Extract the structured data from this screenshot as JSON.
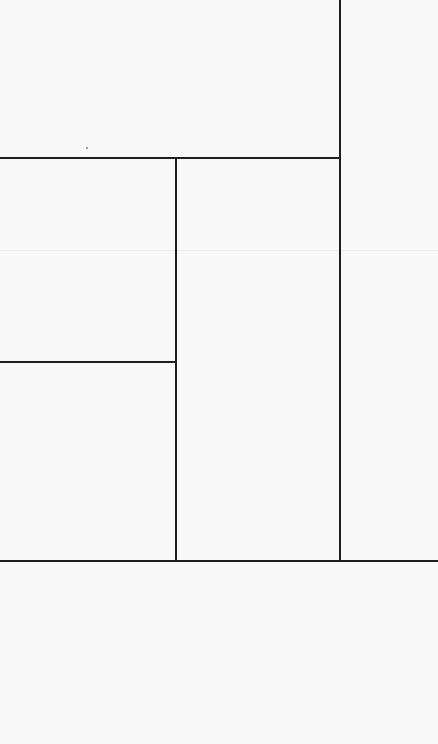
{
  "canvas": {
    "width": 438,
    "height": 744,
    "background": "#f8f8f8",
    "line_color": "#1e1e1e"
  },
  "lines": [
    {
      "orientation": "vertical",
      "x": 339,
      "y1": 0,
      "y2": 560
    },
    {
      "orientation": "horizontal",
      "y": 157,
      "x1": 0,
      "x2": 340
    },
    {
      "orientation": "vertical",
      "x": 175,
      "y1": 157,
      "y2": 560
    },
    {
      "orientation": "horizontal",
      "y": 361,
      "x1": 0,
      "x2": 175
    },
    {
      "orientation": "horizontal",
      "y": 560,
      "x1": 0,
      "x2": 438
    }
  ],
  "faint_lines": [
    {
      "orientation": "horizontal",
      "y": 250,
      "x1": 0,
      "x2": 438
    }
  ]
}
